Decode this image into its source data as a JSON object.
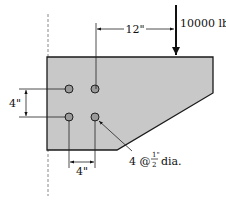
{
  "diagram": {
    "type": "bolted bracket connection",
    "load": {
      "label": "10000 lb",
      "direction": "down"
    },
    "dimensions": {
      "load_offset": "12\"",
      "vertical_bolt_spacing": "4\"",
      "horizontal_bolt_spacing": "4\""
    },
    "bolts": {
      "count_label": "4 @",
      "fraction_num": "1\"",
      "fraction_den": "2",
      "suffix": "dia."
    },
    "colors": {
      "plate_fill": "#c8c8c8",
      "outline": "#1a1a1a",
      "wall_line": "#888888"
    }
  }
}
